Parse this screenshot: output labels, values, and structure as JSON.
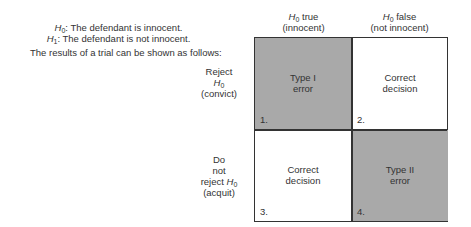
{
  "hypotheses": {
    "h0": {
      "symbol": "H",
      "sub": "0",
      "text": ": The defendant is innocent."
    },
    "h1": {
      "symbol": "H",
      "sub": "1",
      "text": ": The defendant is not innocent."
    }
  },
  "intro": "The results of a trial can be shown as follows:",
  "columns": [
    {
      "symbol": "H",
      "sub": "0",
      "text": " true",
      "sublabel": "(innocent)"
    },
    {
      "symbol": "H",
      "sub": "0",
      "text": " false",
      "sublabel": "(not innocent)"
    }
  ],
  "rows": [
    {
      "line1": "Reject",
      "symbol": "H",
      "sub": "0",
      "sublabel": "(convict)"
    },
    {
      "line1": "Do",
      "line2": "not",
      "line3": "reject ",
      "symbol": "H",
      "sub": "0",
      "sublabel": "(acquit)"
    }
  ],
  "cells": [
    {
      "line1": "Type I",
      "line2": "error",
      "number": "1.",
      "shaded": true
    },
    {
      "line1": "Correct",
      "line2": "decision",
      "number": "2.",
      "shaded": false
    },
    {
      "line1": "Correct",
      "line2": "decision",
      "number": "3.",
      "shaded": false
    },
    {
      "line1": "Type II",
      "line2": "error",
      "number": "4.",
      "shaded": true
    }
  ],
  "colors": {
    "shaded": "#a9a9a9",
    "border": "#333333",
    "text": "#333333"
  }
}
